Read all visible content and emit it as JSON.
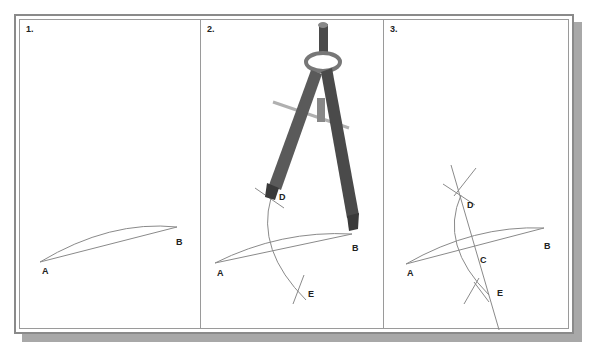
{
  "panels": [
    {
      "step": "1.",
      "labels": {
        "A": "A",
        "B": "B"
      }
    },
    {
      "step": "2.",
      "labels": {
        "A": "A",
        "B": "B",
        "D": "D",
        "E": "E"
      },
      "tool": "compass"
    },
    {
      "step": "3.",
      "labels": {
        "A": "A",
        "B": "B",
        "C": "C",
        "D": "D",
        "E": "E"
      }
    }
  ],
  "colors": {
    "line": "#8a8a8a",
    "frame": "#8a8a8a",
    "shadow": "#a8a8a8",
    "compass": "#555555"
  }
}
